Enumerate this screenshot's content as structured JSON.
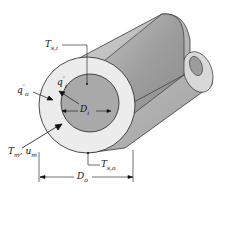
{
  "figure": {
    "labels": {
      "ts_inner": {
        "main": "T",
        "sub": "s,i"
      },
      "q_inner": {
        "main": "q",
        "sup": "″",
        "sub": "i"
      },
      "q_outer": {
        "main": "q",
        "sup": "″",
        "sub": "o"
      },
      "d_inner": {
        "main": "D",
        "sub": "i"
      },
      "tm_um": {
        "main1": "T",
        "sub1": "m",
        "sep": ", ",
        "main2": "u",
        "sub2": "m"
      },
      "ts_outer": {
        "main": "T",
        "sub": "s,o"
      },
      "d_outer": {
        "main": "D",
        "sub": "o"
      }
    },
    "colors": {
      "outer_tube_face": "#e9e9e9",
      "outer_tube_body": "#bdbdbd",
      "inner_tube_face": "#a8a8a8",
      "inner_tube_body": "#9a9a9a",
      "line": "#222222"
    }
  }
}
